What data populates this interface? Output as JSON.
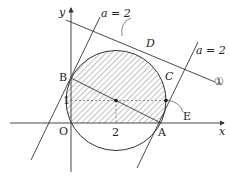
{
  "diagram": {
    "axes": {
      "x_label": "x",
      "y_label": "y",
      "origin_label": "O"
    },
    "ticks": {
      "x_tick": "2",
      "y_tick": "1"
    },
    "points": {
      "A": "A",
      "B": "B",
      "C": "C",
      "D": "D",
      "E": "E"
    },
    "lines": {
      "line_a_left": "a = 2",
      "line_a_right": "a = 2",
      "line_1": "①"
    },
    "circle": {
      "center": [
        2,
        1
      ],
      "radius_sq": 5
    },
    "colors": {
      "stroke": "#333333",
      "hatch": "#555555",
      "background": "#ffffff"
    }
  }
}
